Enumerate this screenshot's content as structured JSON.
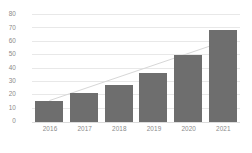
{
  "chart_data": {
    "type": "bar",
    "title": "",
    "subtitle": "",
    "xlabel": "",
    "ylabel": "",
    "categories": [
      "2016",
      "2017",
      "2018",
      "2019",
      "2020",
      "2021"
    ],
    "values": [
      16,
      22,
      28,
      37,
      50,
      69
    ],
    "series": [
      {
        "name": "",
        "values": [
          16,
          22,
          28,
          37,
          50,
          69
        ]
      }
    ],
    "ylim": [
      0,
      80
    ],
    "ytick_labels": [
      "0",
      "10",
      "20",
      "30",
      "40",
      "50",
      "60",
      "70",
      "80"
    ],
    "ytick_values": [
      0,
      10,
      20,
      30,
      40,
      50,
      60,
      70,
      80
    ],
    "grid": true,
    "legend": false,
    "legend_position": "none",
    "annotations": [],
    "trendline": {
      "visible": true,
      "type": "linear",
      "start_value": 16,
      "end_value": 60
    },
    "colors": {
      "bar": "#6e6e6e",
      "gridline": "#e8e8e8",
      "tick_text": "#8a8a8a",
      "trendline": "#d7d7d7",
      "background": "#ffffff"
    }
  }
}
